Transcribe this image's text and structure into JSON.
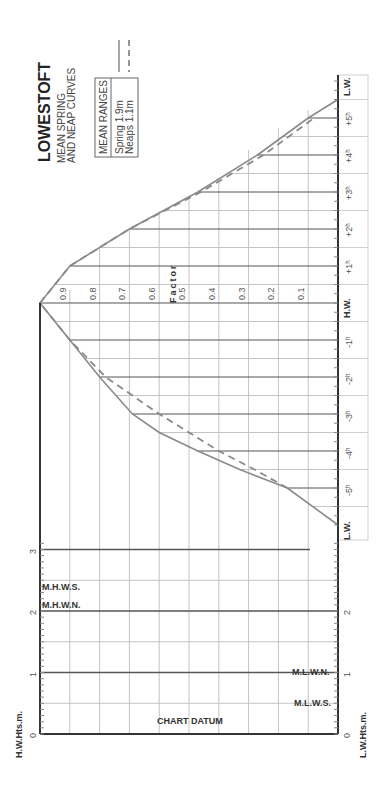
{
  "header": {
    "title": "LOWESTOFT",
    "subtitle_line1": "MEAN SPRING",
    "subtitle_line2": "AND NEAP CURVES"
  },
  "legend": {
    "box_title": "MEAN RANGES",
    "spring_label": "Spring  1.9m",
    "neaps_label": "Neaps   1.1m",
    "spring_style": "solid",
    "neaps_style": "dashed"
  },
  "labels": {
    "factor": "Factor",
    "hw": "H.W.",
    "lw_top": "L.W.",
    "lw_bottom": "L.W.",
    "hw_heights": "H.W.Hts.m.",
    "lw_heights": "L.W.Hts.m.",
    "chart_datum": "CHART DATUM",
    "mhws": "M.H.W.S.",
    "mhwn": "M.H.W.N.",
    "mlwn": "M.L.W.N.",
    "mlws": "M.L.W.S."
  },
  "colors": {
    "curve": "#8a8a8a",
    "grid": "#bdbdbd",
    "axis": "#333333",
    "hour_line": "#555555"
  },
  "chart_data": {
    "type": "line",
    "orientation": "rotated -90deg (time axis vertical, factor axis horizontal)",
    "xlabel": "Hours relative to H.W.",
    "ylabel": "Factor",
    "x": [
      -6,
      -5,
      -4.5,
      -4,
      -3.5,
      -3,
      -2,
      -1,
      0,
      1,
      2,
      3,
      4,
      5,
      5.5
    ],
    "x_tick_labels": [
      "L.W.",
      "-5h",
      "-4h",
      "-3h",
      "-2h",
      "-1h",
      "H.W.",
      "+1h",
      "+2h",
      "+3h",
      "+4h",
      "+5h",
      "L.W."
    ],
    "factor_ticks": [
      0.1,
      0.2,
      0.3,
      0.4,
      0.5,
      0.6,
      0.7,
      0.8,
      0.9
    ],
    "ylim": [
      0,
      1
    ],
    "series": [
      {
        "name": "Spring",
        "style": "solid",
        "values": [
          0.0,
          0.17,
          0.33,
          0.47,
          0.6,
          0.69,
          0.8,
          0.9,
          1.0,
          0.9,
          0.7,
          0.47,
          0.27,
          0.1,
          0.0
        ]
      },
      {
        "name": "Neaps",
        "style": "dashed",
        "values": [
          null,
          0.17,
          0.28,
          0.4,
          0.5,
          0.6,
          0.78,
          0.9,
          1.0,
          0.9,
          0.7,
          0.46,
          0.25,
          0.08,
          null
        ]
      }
    ],
    "height_scale": {
      "label_left": "H.W.Hts.m.",
      "label_right": "L.W.Hts.m.",
      "ticks": [
        0,
        1,
        2,
        3
      ],
      "levels": {
        "M.H.W.S.": 2.4,
        "M.H.W.N.": 2.1,
        "M.L.W.N.": 1.0,
        "M.L.W.S.": 0.5
      }
    },
    "mean_ranges": {
      "Spring": "1.9m",
      "Neaps": "1.1m"
    },
    "grid": true
  }
}
